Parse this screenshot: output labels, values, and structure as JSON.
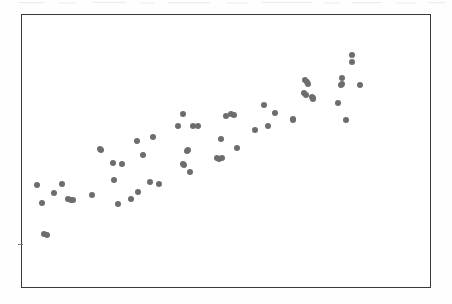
{
  "figure": {
    "type": "scatter-plot",
    "title": "",
    "background_color": "#fefefe",
    "plot_background_color": "#ffffff",
    "frame_color": "#3a3a3a",
    "frame": {
      "x": 21,
      "y": 14,
      "width": 410,
      "height": 274
    },
    "has_axis_labels": false,
    "has_tick_labels": false,
    "has_gridlines": false,
    "has_legend": false,
    "has_title": false,
    "left_axis_tick": {
      "x": 21,
      "y": 244,
      "length": 5
    }
  },
  "chart_data": {
    "type": "scatter",
    "title": "",
    "subtitle": "",
    "xlabel": "",
    "ylabel": "",
    "xlim": [
      0,
      100
    ],
    "ylim": [
      0,
      100
    ],
    "grid": false,
    "legend": false,
    "legend_position": "none",
    "point_color": "#6d6d6d",
    "point_size": 6,
    "n_points": 62,
    "annotations": [],
    "series": [
      {
        "name": "observations",
        "color": "#6d6d6d",
        "points": [
          [
            36,
            184
          ],
          [
            43,
            233
          ],
          [
            41,
            202
          ],
          [
            53,
            192
          ],
          [
            61,
            183
          ],
          [
            67,
            198
          ],
          [
            72,
            199
          ],
          [
            91,
            194
          ],
          [
            100,
            149
          ],
          [
            112,
            162
          ],
          [
            117,
            203
          ],
          [
            121,
            163
          ],
          [
            113,
            179
          ],
          [
            130,
            198
          ],
          [
            136,
            140
          ],
          [
            137,
            191
          ],
          [
            142,
            154
          ],
          [
            149,
            181
          ],
          [
            152,
            136
          ],
          [
            158,
            183
          ],
          [
            177,
            125
          ],
          [
            182,
            113
          ],
          [
            182,
            163
          ],
          [
            183,
            164
          ],
          [
            187,
            149
          ],
          [
            189,
            171
          ],
          [
            192,
            125
          ],
          [
            197,
            125
          ],
          [
            216,
            157
          ],
          [
            221,
            157
          ],
          [
            220,
            138
          ],
          [
            225,
            115
          ],
          [
            230,
            113
          ],
          [
            236,
            147
          ],
          [
            254,
            129
          ],
          [
            263,
            104
          ],
          [
            267,
            125
          ],
          [
            274,
            112
          ],
          [
            292,
            118
          ],
          [
            292,
            119
          ],
          [
            303,
            92
          ],
          [
            304,
            79
          ],
          [
            305,
            94
          ],
          [
            307,
            83
          ],
          [
            312,
            97
          ],
          [
            312,
            98
          ],
          [
            337,
            102
          ],
          [
            341,
            77
          ],
          [
            341,
            83
          ],
          [
            345,
            119
          ],
          [
            351,
            54
          ],
          [
            351,
            61
          ],
          [
            359,
            84
          ],
          [
            70,
            199
          ],
          [
            186,
            150
          ],
          [
            218,
            158
          ],
          [
            233,
            114
          ],
          [
            306,
            81
          ],
          [
            340,
            84
          ],
          [
            311,
            96
          ],
          [
            46,
            234
          ],
          [
            99,
            148
          ]
        ]
      }
    ]
  },
  "accessibility": {
    "role": "img",
    "alt": "Scatter plot showing a positive correlation between two unlabeled variables"
  }
}
